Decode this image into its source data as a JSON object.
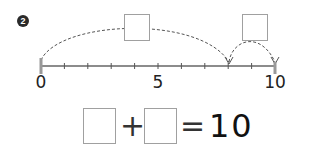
{
  "problem": {
    "number_badge": "2"
  },
  "number_line": {
    "start": 0,
    "end": 10,
    "labels": [
      {
        "value": 0,
        "text": "0"
      },
      {
        "value": 5,
        "text": "5"
      },
      {
        "value": 10,
        "text": "10"
      }
    ],
    "jumps": [
      {
        "from": 0,
        "to": 8,
        "answer": ""
      },
      {
        "from": 8,
        "to": 10,
        "answer": ""
      }
    ]
  },
  "equation": {
    "addend1": "",
    "plus": "+",
    "addend2": "",
    "equals": "=",
    "result": "10"
  }
}
